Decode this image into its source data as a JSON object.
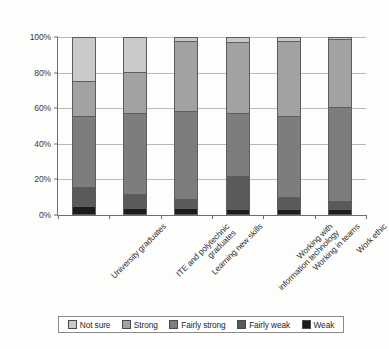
{
  "chart_data": {
    "type": "bar",
    "variant": "stacked-100-percent",
    "title": "",
    "xlabel": "",
    "ylabel": "",
    "ylim": [
      0,
      100
    ],
    "ytick_labels": [
      "0%",
      "20%",
      "40%",
      "60%",
      "80%",
      "100%"
    ],
    "ytick_values": [
      0,
      20,
      40,
      60,
      80,
      100
    ],
    "grid": true,
    "legend_position": "bottom",
    "categories": [
      "University graduates",
      "ITE and polytechnic graduates",
      "Learning new skills",
      "Working with information technology",
      "Working in teams",
      "Work ethic"
    ],
    "series": [
      {
        "name": "Weak",
        "color": "#1c1c1c",
        "values": [
          4,
          3,
          3,
          2,
          2,
          2
        ]
      },
      {
        "name": "Fairly weak",
        "color": "#5a5a5a",
        "values": [
          11,
          8,
          5,
          19,
          7,
          5
        ]
      },
      {
        "name": "Fairly strong",
        "color": "#7d7d7d",
        "values": [
          40,
          46,
          50,
          36,
          46,
          53
        ]
      },
      {
        "name": "Strong",
        "color": "#a2a2a2",
        "values": [
          20,
          23,
          40,
          40,
          43,
          39
        ]
      },
      {
        "name": "Not sure",
        "color": "#c9c9c9",
        "values": [
          25,
          20,
          2,
          3,
          2,
          1
        ]
      }
    ],
    "legend_entries": [
      {
        "label": "Not sure",
        "color": "#c9c9c9"
      },
      {
        "label": "Strong",
        "color": "#a2a2a2"
      },
      {
        "label": "Fairly strong",
        "color": "#7d7d7d"
      },
      {
        "label": "Fairly weak",
        "color": "#5a5a5a"
      },
      {
        "label": "Weak",
        "color": "#1c1c1c"
      }
    ]
  }
}
